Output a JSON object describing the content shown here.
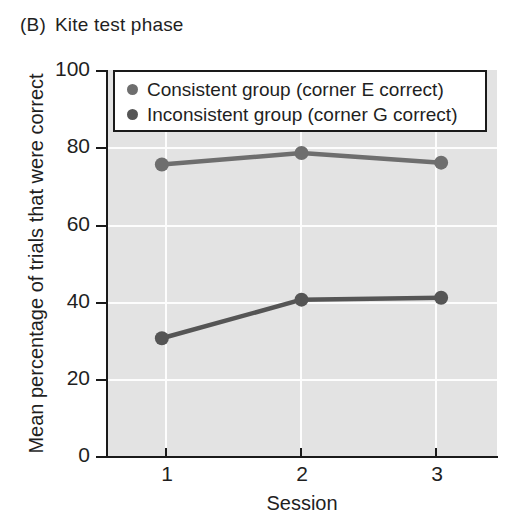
{
  "panel": {
    "label": "(B)",
    "title": "Kite test phase"
  },
  "colors": {
    "plot_background": "#e3e3e3",
    "gridline": "#fdfdfd",
    "axis": "#1a1a1a",
    "series_consistent": "#6e6e6e",
    "series_inconsistent": "#555555",
    "page_background": "#ffffff"
  },
  "legend": {
    "position": "top-inside",
    "entries": [
      {
        "label": "Consistent group (corner E correct)",
        "marker": "circle",
        "color": "#6e6e6e"
      },
      {
        "label": "Inconsistent group (corner G correct)",
        "marker": "circle",
        "color": "#555555"
      }
    ]
  },
  "axes": {
    "x": {
      "title": "Session",
      "ticks": [
        "1",
        "2",
        "3"
      ],
      "range": [
        0.6,
        3.4
      ]
    },
    "y": {
      "title": "Mean percentage of trials that were correct",
      "ticks": [
        "0",
        "20",
        "40",
        "60",
        "80",
        "100"
      ],
      "range": [
        0,
        100
      ]
    }
  },
  "chart_data": {
    "type": "line",
    "xlabel": "Session",
    "ylabel": "Mean percentage of trials that were correct",
    "x": [
      1,
      2,
      3
    ],
    "categories": [
      "1",
      "2",
      "3"
    ],
    "xlim": [
      0.6,
      3.4
    ],
    "ylim": [
      0,
      100
    ],
    "yticks": [
      0,
      20,
      40,
      60,
      80,
      100
    ],
    "grid": true,
    "legend_position": "upper-inside",
    "series": [
      {
        "name": "Consistent group (corner E correct)",
        "color": "#6e6e6e",
        "values": [
          75.5,
          78.5,
          76
        ]
      },
      {
        "name": "Inconsistent group (corner G correct)",
        "color": "#555555",
        "values": [
          30.5,
          40.5,
          41
        ]
      }
    ]
  }
}
